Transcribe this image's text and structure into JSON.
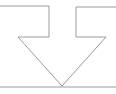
{
  "diagram": {
    "type": "down-arrow-with-baseline",
    "stroke_color": "#9a9a9a",
    "background": "#ffffff",
    "arrow_outline_points": "0,6 49,6 49,37 18,37 62,86 106,37 76,37 76,7 116,7",
    "baseline": {
      "x1": 0,
      "y1": 87,
      "x2": 116,
      "y2": 87
    }
  }
}
